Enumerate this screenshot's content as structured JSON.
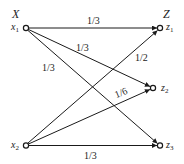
{
  "diagram": {
    "type": "bipartite-transition-graph",
    "colors": {
      "line": "#1a1a1a",
      "text": "#222222",
      "background": "#ffffff"
    },
    "sets": {
      "left": {
        "label": "X"
      },
      "right": {
        "label": "Z"
      }
    },
    "nodes": [
      {
        "id": "x1",
        "var": "x",
        "sub": "1",
        "side": "left"
      },
      {
        "id": "x2",
        "var": "x",
        "sub": "2",
        "side": "left"
      },
      {
        "id": "z1",
        "var": "z",
        "sub": "1",
        "side": "right"
      },
      {
        "id": "z2",
        "var": "z",
        "sub": "2",
        "side": "right"
      },
      {
        "id": "z3",
        "var": "z",
        "sub": "3",
        "side": "right"
      }
    ],
    "edges": [
      {
        "from": "x1",
        "to": "z1",
        "weight": "1/3"
      },
      {
        "from": "x1",
        "to": "z2",
        "weight": "1/3"
      },
      {
        "from": "x1",
        "to": "z3",
        "weight": "1/3"
      },
      {
        "from": "x2",
        "to": "z1",
        "weight": "1/2"
      },
      {
        "from": "x2",
        "to": "z2",
        "weight": "1/6"
      },
      {
        "from": "x2",
        "to": "z3",
        "weight": "1/3"
      }
    ]
  }
}
